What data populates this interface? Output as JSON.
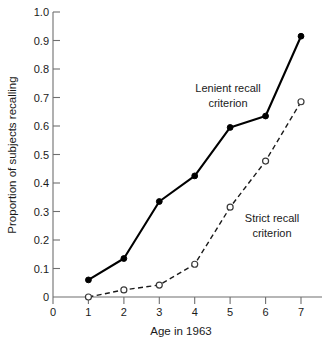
{
  "chart_data": {
    "type": "line",
    "title": "",
    "xlabel": "Age in 1963",
    "ylabel": "Proportion of subjects recalling",
    "x": [
      1,
      2,
      3,
      4,
      5,
      6,
      7
    ],
    "xlim": [
      0,
      7.4
    ],
    "ylim": [
      0,
      1.0
    ],
    "xticks": [
      0,
      1,
      2,
      3,
      4,
      5,
      6,
      7
    ],
    "xtick_labels": [
      "0",
      "1",
      "2",
      "3",
      "4",
      "5",
      "6",
      "7"
    ],
    "yticks": [
      0,
      0.1,
      0.2,
      0.3,
      0.4,
      0.5,
      0.6,
      0.7,
      0.8,
      0.9,
      1.0
    ],
    "ytick_labels": [
      "0",
      "0.1",
      "0.2",
      "0.3",
      "0.4",
      "0.5",
      "0.6",
      "0.7",
      "0.8",
      "0.9",
      "1.0"
    ],
    "grid": false,
    "legend_position": "inline-annotations",
    "series": [
      {
        "name": "Lenient recall criterion",
        "marker": "filled-circle",
        "linestyle": "solid",
        "color": "#000000",
        "values": [
          0.06,
          0.135,
          0.335,
          0.425,
          0.595,
          0.635,
          0.915
        ]
      },
      {
        "name": "Strict recall criterion",
        "marker": "open-circle",
        "linestyle": "dashed",
        "color": "#1a1a1a",
        "values": [
          0.0,
          0.025,
          0.042,
          0.115,
          0.315,
          0.477,
          0.685
        ]
      }
    ],
    "annotations": [
      {
        "text_line1": "Lenient recall",
        "text_line2": "criterion",
        "x": 4.95,
        "y": 0.755
      },
      {
        "text_line1": "Strict recall",
        "text_line2": "criterion",
        "x": 6.2,
        "y": 0.295
      }
    ]
  },
  "axis": {
    "x_title": "Age in 1963",
    "y_title": "Proportion of subjects recalling"
  },
  "labels": {
    "y": [
      "1.0",
      "0.9",
      "0.8",
      "0.7",
      "0.6",
      "0.5",
      "0.4",
      "0.3",
      "0.2",
      "0.1",
      "0"
    ],
    "x": [
      "0",
      "1",
      "2",
      "3",
      "4",
      "5",
      "6",
      "7"
    ]
  },
  "annotation_lenient": {
    "line1": "Lenient recall",
    "line2": "criterion"
  },
  "annotation_strict": {
    "line1": "Strict recall",
    "line2": "criterion"
  }
}
